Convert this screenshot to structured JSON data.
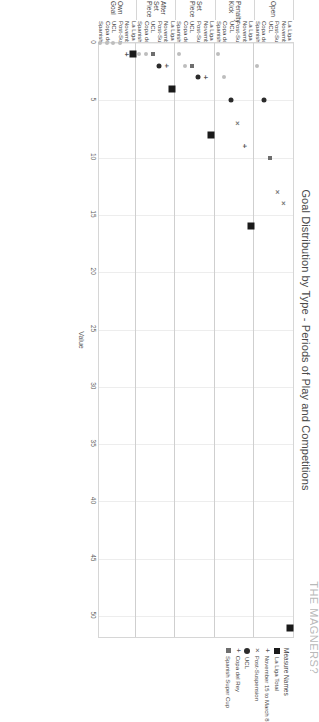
{
  "watermark": "THE MAGNERS?",
  "chart_data": {
    "type": "scatter",
    "title": "Goal Distribution by Type - Periods of Play and Competitions",
    "xlabel": "Value",
    "ylabel": "",
    "grid": true,
    "legend_position": "right",
    "xlim": [
      0,
      52
    ],
    "xticks": [
      "0",
      "5",
      "10",
      "15",
      "20",
      "25",
      "30",
      "35",
      "40",
      "45",
      "50"
    ],
    "legend_title": "Measure Names",
    "series": [
      {
        "name": "La Liga Total",
        "marker": "square-large"
      },
      {
        "name": "November 15 to March 8",
        "marker": "plus"
      },
      {
        "name": "Post-Suspension",
        "marker": "cross"
      },
      {
        "name": "UCL",
        "marker": "circle"
      },
      {
        "name": "Copa del Rey",
        "marker": "plus"
      },
      {
        "name": "Spanish Super Cup",
        "marker": "square-small"
      }
    ],
    "groups": [
      {
        "label": "Open",
        "rows": [
          {
            "label": "La Liga Total",
            "value": 51,
            "marker": "square-large"
          },
          {
            "label": "November 15 to March 8",
            "value": 14,
            "marker": "cross"
          },
          {
            "label": "Post-Suspension",
            "value": 13,
            "marker": "cross"
          },
          {
            "label": "UCL",
            "value": 10,
            "marker": "square-small"
          },
          {
            "label": "Copa del Rey",
            "value": 5,
            "marker": "circle"
          },
          {
            "label": "Spanish Super Cup",
            "value": 2,
            "marker": "dot-faint"
          }
        ]
      },
      {
        "label": "Penalty Kick",
        "rows": [
          {
            "label": "La Liga Total",
            "value": 16,
            "marker": "square-large"
          },
          {
            "label": "November 15 to March 8",
            "value": 9,
            "marker": "plus"
          },
          {
            "label": "Post-Suspension",
            "value": 7,
            "marker": "cross"
          },
          {
            "label": "UCL",
            "value": 5,
            "marker": "circle"
          },
          {
            "label": "Copa del Rey",
            "value": 3,
            "marker": "dot-faint"
          },
          {
            "label": "Spanish Super Cup",
            "value": 1,
            "marker": "dot-faint"
          }
        ]
      },
      {
        "label": "Set Piece",
        "rows": [
          {
            "label": "La Liga Total",
            "value": 8,
            "marker": "square-large"
          },
          {
            "label": "November 15 to March 8",
            "value": 3,
            "marker": "plus"
          },
          {
            "label": "Post-Suspension",
            "value": 3,
            "marker": "circle"
          },
          {
            "label": "UCL",
            "value": 2,
            "marker": "square-small"
          },
          {
            "label": "Copa del Rey",
            "value": 2,
            "marker": "dot-faint"
          },
          {
            "label": "Spanish Super Cup",
            "value": 1,
            "marker": "dot-faint"
          }
        ]
      },
      {
        "label": "After Set Piece",
        "rows": [
          {
            "label": "La Liga Total",
            "value": 4,
            "marker": "square-large"
          },
          {
            "label": "November 15 to March 8",
            "value": 2,
            "marker": "plus"
          },
          {
            "label": "Post-Suspension",
            "value": 2,
            "marker": "circle"
          },
          {
            "label": "UCL",
            "value": 1,
            "marker": "square-small"
          },
          {
            "label": "Copa del Rey",
            "value": 1,
            "marker": "dot-faint"
          },
          {
            "label": "Spanish Super Cup",
            "value": 1,
            "marker": "dot-faint"
          }
        ]
      },
      {
        "label": "Own Goal",
        "rows": [
          {
            "label": "La Liga Total",
            "value": 1,
            "marker": "square-large"
          },
          {
            "label": "November 15 to March 8",
            "value": 1,
            "marker": "plus"
          },
          {
            "label": "Post-Suspension",
            "value": 0,
            "marker": "dot-faint"
          },
          {
            "label": "UCL",
            "value": 0,
            "marker": "dot-faint"
          },
          {
            "label": "Copa del Rey",
            "value": 0,
            "marker": "dot-faint"
          },
          {
            "label": "Spanish Super Cup",
            "value": 0,
            "marker": "dot-faint"
          }
        ]
      }
    ]
  }
}
